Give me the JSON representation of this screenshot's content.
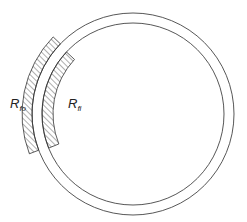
{
  "diagram": {
    "tube": {
      "center": [
        133,
        114
      ],
      "outer_radius": 101,
      "inner_radius": 91,
      "stroke": "#444444"
    },
    "fouling_outer": {
      "label_main": "R",
      "label_sub": "fo",
      "r_inner": 101,
      "r_outer": 111,
      "start_deg": 159,
      "end_deg": 224
    },
    "fouling_inner": {
      "label_main": "R",
      "label_sub": "fi",
      "r_inner": 80,
      "r_outer": 91,
      "start_deg": 158,
      "end_deg": 223
    },
    "hatch_color": "#333333"
  }
}
